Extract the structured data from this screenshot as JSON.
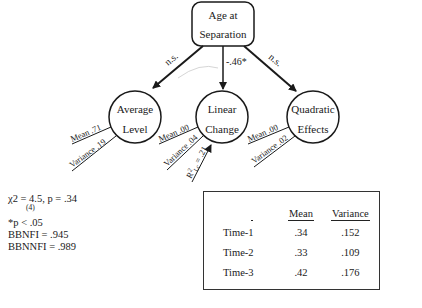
{
  "diagram": {
    "top_node": {
      "line1": "Age at",
      "line2": "Separation"
    },
    "factors": [
      {
        "line1": "Average",
        "line2": "Level",
        "path_label": "n.s.",
        "mean_label": "Mean .71",
        "variance_label": "Variance .19"
      },
      {
        "line1": "Linear",
        "line2": "Change",
        "path_label": "-.46*",
        "mean_label": "Mean .00",
        "variance_label": "Variance .04",
        "r2_base": "R",
        "r2_sup": "2",
        "r2_sub": "Lc",
        "r2_value": " = .21"
      },
      {
        "line1": "Quadratic",
        "line2": "Effects",
        "path_label": "n.s.",
        "mean_label": "Mean .00",
        "variance_label": "Variance .02"
      }
    ]
  },
  "stats": {
    "chi_square": "χ2 = 4.5, p = .34",
    "df": "(4)",
    "significance": "*p < .05",
    "bbnfi": "BBNFI = .945",
    "bbnnfi": "BBNNFI = .989"
  },
  "table": {
    "headers": [
      "",
      "Mean",
      "Variance"
    ],
    "rows": [
      {
        "label": "Time-1",
        "mean": ".34",
        "variance": ".152"
      },
      {
        "label": "Time-2",
        "mean": ".33",
        "variance": ".109"
      },
      {
        "label": "Time-3",
        "mean": ".42",
        "variance": ".176"
      }
    ]
  }
}
